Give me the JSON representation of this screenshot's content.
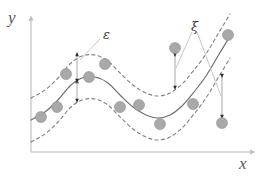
{
  "figure": {
    "name": "svr-epsilon-tube-diagram",
    "width": 266,
    "height": 180,
    "background": "#ffffff"
  },
  "axes": {
    "x_label": "x",
    "y_label": "y",
    "axis_color": "#b8bcc0",
    "origin": {
      "x": 31,
      "y": 152
    },
    "x_axis_end": {
      "x": 256,
      "y": 152
    },
    "y_axis_end": {
      "x": 31,
      "y": 15
    }
  },
  "annotations": [
    {
      "id": "epsilon",
      "symbol": "ε",
      "meaning": "epsilon-insensitive tube half-width",
      "label_pos": {
        "x": 103,
        "y": 28
      },
      "color": "#3a3d40"
    },
    {
      "id": "xi",
      "symbol": "ξ",
      "meaning": "slack variable",
      "label_pos": {
        "x": 191,
        "y": 20
      },
      "color": "#3a3d40"
    }
  ],
  "chart_data": {
    "type": "line",
    "title": "",
    "subtitle": "",
    "xlabel": "x",
    "ylabel": "y",
    "xlim": [
      31,
      256
    ],
    "ylim": [
      152,
      15
    ],
    "grid": false,
    "legend": null,
    "axis_direction": "y increases upward",
    "series": [
      {
        "name": "regression-curve",
        "role": "fitted function f(x)",
        "style": "solid",
        "color": "#6b7075",
        "width": 1.2,
        "points": [
          [
            31,
            120
          ],
          [
            45,
            112
          ],
          [
            58,
            100
          ],
          [
            70,
            86
          ],
          [
            82,
            78
          ],
          [
            95,
            77
          ],
          [
            108,
            83
          ],
          [
            120,
            95
          ],
          [
            133,
            107
          ],
          [
            146,
            115
          ],
          [
            158,
            118
          ],
          [
            170,
            115
          ],
          [
            182,
            106
          ],
          [
            194,
            92
          ],
          [
            206,
            76
          ],
          [
            218,
            56
          ],
          [
            230,
            36
          ]
        ]
      },
      {
        "name": "upper-tube-boundary",
        "role": "f(x) + epsilon",
        "style": "dashed",
        "color": "#7d8287",
        "width": 1.1,
        "points": [
          [
            31,
            98
          ],
          [
            45,
            90
          ],
          [
            58,
            78
          ],
          [
            70,
            64
          ],
          [
            82,
            56
          ],
          [
            95,
            55
          ],
          [
            108,
            61
          ],
          [
            120,
            73
          ],
          [
            133,
            85
          ],
          [
            146,
            93
          ],
          [
            158,
            96
          ],
          [
            170,
            93
          ],
          [
            182,
            84
          ],
          [
            194,
            70
          ],
          [
            206,
            54
          ],
          [
            218,
            34
          ],
          [
            230,
            14
          ]
        ]
      },
      {
        "name": "lower-tube-boundary",
        "role": "f(x) - epsilon",
        "style": "dashed",
        "color": "#7d8287",
        "width": 1.1,
        "points": [
          [
            31,
            142
          ],
          [
            45,
            134
          ],
          [
            58,
            122
          ],
          [
            70,
            108
          ],
          [
            82,
            100
          ],
          [
            95,
            99
          ],
          [
            108,
            105
          ],
          [
            120,
            117
          ],
          [
            133,
            129
          ],
          [
            146,
            137
          ],
          [
            158,
            140
          ],
          [
            170,
            137
          ],
          [
            182,
            128
          ],
          [
            194,
            114
          ],
          [
            206,
            98
          ],
          [
            218,
            78
          ],
          [
            230,
            58
          ]
        ]
      }
    ],
    "scatter": {
      "name": "training-points",
      "marker": "circle",
      "radius": 5.5,
      "fill": "#a9a9a9",
      "stroke": "#8e8e8e",
      "points": [
        {
          "x": 41,
          "y": 117,
          "inside_tube": true
        },
        {
          "x": 57,
          "y": 107,
          "inside_tube": true
        },
        {
          "x": 66,
          "y": 74,
          "inside_tube": true
        },
        {
          "x": 89,
          "y": 77,
          "inside_tube": true
        },
        {
          "x": 105,
          "y": 64,
          "inside_tube": true
        },
        {
          "x": 120,
          "y": 107,
          "inside_tube": true
        },
        {
          "x": 139,
          "y": 105,
          "inside_tube": true
        },
        {
          "x": 160,
          "y": 124,
          "inside_tube": true
        },
        {
          "x": 175,
          "y": 48,
          "inside_tube": false,
          "violation": "above-upper-boundary"
        },
        {
          "x": 193,
          "y": 104,
          "inside_tube": true
        },
        {
          "x": 222,
          "y": 123,
          "inside_tube": false,
          "violation": "below-lower-boundary"
        },
        {
          "x": 228,
          "y": 35,
          "inside_tube": true
        }
      ]
    },
    "measure_arrows": [
      {
        "id": "epsilon-upper",
        "name": "epsilon-upper-arrow",
        "orientation": "vertical",
        "x": 77,
        "y_from": 81,
        "y_to": 54,
        "double_headed": true,
        "labelled_by": "epsilon"
      },
      {
        "id": "epsilon-lower",
        "name": "epsilon-lower-arrow",
        "orientation": "vertical",
        "x": 77,
        "y_from": 81,
        "y_to": 101,
        "double_headed": true,
        "labelled_by": "epsilon"
      },
      {
        "id": "xi-upper",
        "name": "xi-slack-arrow-upper",
        "orientation": "vertical",
        "x": 175,
        "y_from": 55,
        "y_to": 88,
        "double_headed": true,
        "labelled_by": "xi"
      },
      {
        "id": "xi-lower",
        "name": "xi-slack-arrow-lower",
        "orientation": "vertical",
        "x": 222,
        "y_from": 76,
        "y_to": 117,
        "double_headed": true,
        "labelled_by": "xi"
      }
    ],
    "leader_lines": [
      {
        "id": "epsilon-leader",
        "from": {
          "x": 100,
          "y": 39
        },
        "to": {
          "x": 80,
          "y": 60
        }
      },
      {
        "id": "xi-leader-1",
        "from": {
          "x": 192,
          "y": 32
        },
        "to": {
          "x": 176,
          "y": 68
        }
      },
      {
        "id": "xi-leader-2",
        "from": {
          "x": 197,
          "y": 32
        },
        "to": {
          "x": 221,
          "y": 96
        }
      }
    ]
  }
}
